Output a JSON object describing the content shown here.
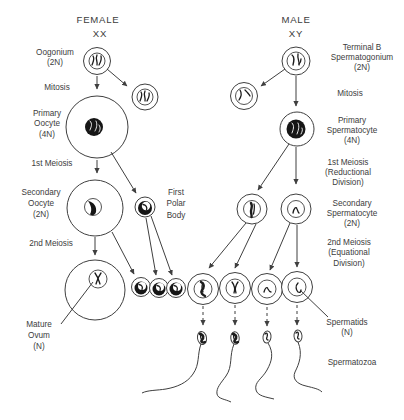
{
  "diagram": {
    "title_implicit": "Gametogenesis: oogenesis vs spermatogenesis",
    "colors": {
      "ink": "#3c3c3c",
      "dark_fill": "#161616",
      "background": "#ffffff"
    },
    "female": {
      "heading": "FEMALE",
      "karyotype": "XX",
      "oogonium": [
        "Oogonium",
        "(2N)"
      ],
      "mitosis": "Mitosis",
      "primary_oocyte": [
        "Primary",
        "Oocyte",
        "(4N)"
      ],
      "first_meiosis": "1st Meiosis",
      "secondary_oocyte": [
        "Secondary",
        "Oocyte",
        "(2N)"
      ],
      "first_polar_body": [
        "First",
        "Polar",
        "Body"
      ],
      "second_meiosis": "2nd Meiosis",
      "mature_ovum": [
        "Mature",
        "Ovum",
        "(N)"
      ]
    },
    "male": {
      "heading": "MALE",
      "karyotype": "XY",
      "spermatogonium": [
        "Terminal B",
        "Spermatogonium",
        "(2N)"
      ],
      "mitosis": "Mitosis",
      "primary_spermatocyte": [
        "Primary",
        "Spermatocyte",
        "(4N)"
      ],
      "first_meiosis": [
        "1st Meiosis",
        "(Reductional",
        "Division)"
      ],
      "secondary_spermatocyte": [
        "Secondary",
        "Spermatocyte",
        "(2N)"
      ],
      "second_meiosis": [
        "2nd Meiosis",
        "(Equational",
        "Division)"
      ],
      "spermatids": [
        "Spermatids",
        "(N)"
      ],
      "spermatozoa": "Spermatozoa"
    }
  }
}
